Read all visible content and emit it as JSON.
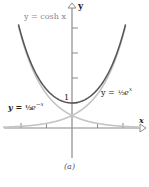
{
  "figure": {
    "caption": "(a)",
    "axes": {
      "x_label": "x",
      "y_label": "y",
      "origin_px": [
        72,
        128
      ],
      "unit_px": 25,
      "x_ticks": [
        -2,
        -1,
        1,
        2
      ],
      "y_ticks": [
        1,
        2,
        3,
        4
      ],
      "y_tick_label": "1"
    },
    "curves": [
      {
        "name": "cosh",
        "label": "y = cosh x",
        "color": "#555555"
      },
      {
        "name": "half-exp",
        "label_prefix": "y = ",
        "label_frac": "½",
        "label_base": "e",
        "label_exp": "x",
        "color": "#c4c4c4"
      },
      {
        "name": "half-exp-neg",
        "label_prefix": "y = ",
        "label_frac": "½",
        "label_base": "e",
        "label_exp": "−x",
        "color": "#c4c4c4"
      }
    ],
    "colors": {
      "axis": "#777777",
      "text_dark": "#222222",
      "text_gray": "#888888"
    }
  }
}
